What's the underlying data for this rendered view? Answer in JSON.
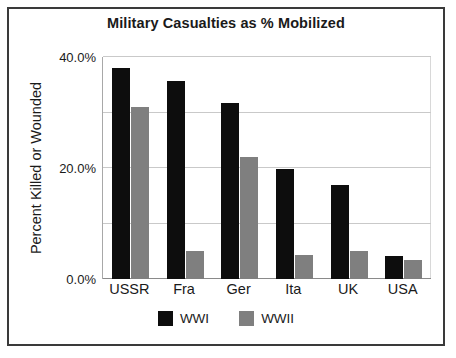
{
  "chart_data": {
    "type": "bar",
    "title": "Military Casualties as % Mobilized",
    "xlabel": "",
    "ylabel": "Percent Killed or Wounded",
    "categories": [
      "USSR",
      "Fra",
      "Ger",
      "Ita",
      "UK",
      "USA"
    ],
    "series": [
      {
        "name": "WWI",
        "color": "#0d0d0d",
        "values": [
          76.0,
          71.5,
          63.5,
          39.5,
          34.0,
          8.3
        ]
      },
      {
        "name": "WWII",
        "color": "#7f7f7f",
        "values": [
          62.0,
          10.0,
          44.0,
          8.5,
          10.0,
          7.0
        ]
      }
    ],
    "ylim": [
      0,
      80
    ],
    "ytick_labels": [
      "0.0%",
      "20.0%",
      "40.0%",
      "60.0%",
      "80.0%"
    ],
    "ytick_values": [
      0,
      20,
      40,
      60,
      80
    ],
    "grid": true,
    "legend_position": "bottom"
  },
  "colors": {
    "series_wwi": "#0d0d0d",
    "series_wwii": "#7f7f7f",
    "gridline": "#c9c9c9",
    "axis": "#8a8a8a",
    "frame_border": "#3a3a3a",
    "background": "#ffffff",
    "text": "#1a1a1a"
  }
}
